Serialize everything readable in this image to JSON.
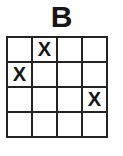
{
  "title": "B",
  "grid": {
    "rows": 4,
    "cols": 4,
    "mark_symbol": "X",
    "cells": [
      [
        "",
        "X",
        "",
        ""
      ],
      [
        "X",
        "",
        "",
        ""
      ],
      [
        "",
        "",
        "",
        "X"
      ],
      [
        "",
        "",
        "",
        ""
      ]
    ]
  },
  "colors": {
    "background": "#ffffff",
    "cell_fill": "#ffffff",
    "grid_line": "#242424",
    "text": "#161616"
  }
}
